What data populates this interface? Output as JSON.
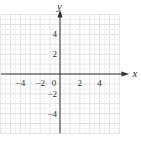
{
  "chart_data": {
    "type": "scatter",
    "title": "",
    "xlabel": "x",
    "ylabel": "y",
    "xlim": [
      -6,
      6
    ],
    "ylim": [
      -6,
      6
    ],
    "grid": true,
    "grid_step": 1,
    "x_ticks": [
      -4,
      -2,
      0,
      2,
      4
    ],
    "y_ticks": [
      4,
      2,
      -2,
      -4
    ],
    "x_tick_labels": [
      "−4",
      "−2",
      "0",
      "2",
      "4"
    ],
    "y_tick_labels": [
      "4",
      "2",
      "−2",
      "−4"
    ],
    "series": []
  },
  "colors": {
    "grid": "#e6e6e6",
    "axis": "#333333"
  }
}
